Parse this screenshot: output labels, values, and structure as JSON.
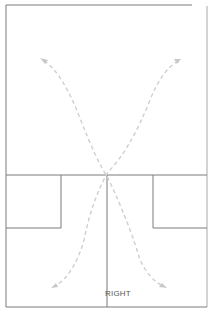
{
  "diagram": {
    "type": "court-layout",
    "label": "RIGHT",
    "colors": {
      "lines": "#7a7a7a",
      "arrows": "#cfcfcf"
    },
    "elements": [
      {
        "name": "outer-frame"
      },
      {
        "name": "mid-line-horizontal"
      },
      {
        "name": "center-line-vertical"
      },
      {
        "name": "left-service-box"
      },
      {
        "name": "right-service-box"
      },
      {
        "name": "arrow-crosscourt-left-to-right"
      },
      {
        "name": "arrow-crosscourt-right-to-left"
      }
    ]
  }
}
